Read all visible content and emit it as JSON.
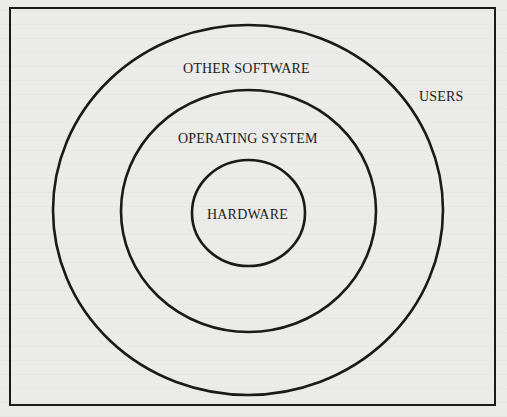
{
  "diagram": {
    "type": "concentric-layers",
    "layers": [
      {
        "name": "users",
        "label": "USERS"
      },
      {
        "name": "other-software",
        "label": "OTHER SOFTWARE"
      },
      {
        "name": "operating-system",
        "label": "OPERATING SYSTEM"
      },
      {
        "name": "hardware",
        "label": "HARDWARE"
      }
    ],
    "colors": {
      "background": "#ebebea",
      "stroke": "#1a1a1a",
      "text": "#1c1c1c"
    }
  }
}
